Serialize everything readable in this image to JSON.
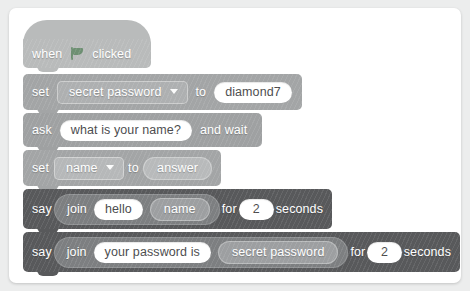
{
  "scene": {
    "description": "Scratch-style block script",
    "card_background": "#ffffff",
    "page_background": "#eceded"
  },
  "palette": {
    "event_block": "#b9bbbb",
    "data_block": "#a3a5a6",
    "sensing_block": "#9fa1a2",
    "looks_block": "#58595b",
    "flag_green": "#6d8f72",
    "input_white": "#ffffff",
    "text_white": "#ffffff"
  },
  "script": {
    "blocks": [
      {
        "id": "when-flag-clicked",
        "type": "hat",
        "words": {
          "when": "when",
          "clicked": "clicked"
        },
        "icon": "green-flag-icon"
      },
      {
        "id": "set-secret-password",
        "type": "data",
        "words": {
          "set": "set",
          "to": "to"
        },
        "variable": "secret password",
        "value": "diamond7"
      },
      {
        "id": "ask-and-wait",
        "type": "sensing",
        "words": {
          "ask": "ask",
          "and_wait": "and wait"
        },
        "question": "what is your name?"
      },
      {
        "id": "set-name",
        "type": "data",
        "words": {
          "set": "set",
          "to": "to"
        },
        "variable": "name",
        "value_reporter": "answer"
      },
      {
        "id": "say-hello-name",
        "type": "looks",
        "words": {
          "say": "say",
          "join": "join",
          "for": "for",
          "seconds": "seconds"
        },
        "join_left": "hello",
        "join_right_reporter": "name",
        "duration": "2"
      },
      {
        "id": "say-your-password-is",
        "type": "looks",
        "words": {
          "say": "say",
          "join": "join",
          "for": "for",
          "seconds": "seconds"
        },
        "join_left": "your password is",
        "join_right_reporter": "secret password",
        "duration": "2"
      }
    ]
  }
}
